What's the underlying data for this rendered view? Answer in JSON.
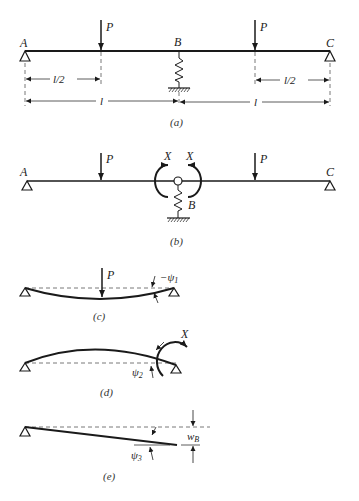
{
  "figure": {
    "panels": {
      "a": {
        "caption": "(a)",
        "labels": {
          "A": "A",
          "B": "B",
          "C": "C",
          "P_left": "P",
          "P_right": "P"
        },
        "dimensions": {
          "half_left": "l/2",
          "half_right": "l/2",
          "span_left": "l",
          "span_right": "l"
        }
      },
      "b": {
        "caption": "(b)",
        "labels": {
          "A": "A",
          "B": "B",
          "C": "C",
          "P_left": "P",
          "P_right": "P",
          "X_left": "X",
          "X_right": "X"
        }
      },
      "c": {
        "caption": "(c)",
        "labels": {
          "P": "P",
          "psi": "−ψ",
          "psi_sub": "1"
        }
      },
      "d": {
        "caption": "(d)",
        "labels": {
          "X": "X",
          "psi": "ψ",
          "psi_sub": "2"
        }
      },
      "e": {
        "caption": "(e)",
        "labels": {
          "psi": "ψ",
          "psi_sub": "3",
          "w": "w",
          "w_sub": "B"
        }
      }
    },
    "colors": {
      "ink": "#1a1a1a",
      "dash": "#555555"
    }
  }
}
